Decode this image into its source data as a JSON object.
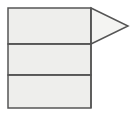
{
  "figure": {
    "canvas": {
      "width": 134,
      "height": 118,
      "background_color": "#ffffff"
    },
    "style": {
      "band_fill_color": "#eeeeec",
      "arrow_fill_color": "#f4f4f2",
      "stroke_color": "#555555",
      "stroke_width": 1.5
    },
    "shapes": {
      "rectangle": {
        "name": "stacked-band-rectangle",
        "x": 8,
        "y": 8,
        "width": 83,
        "height": 100,
        "fill": "#eeeeec",
        "stroke": "#555555"
      },
      "bands": [
        {
          "name": "band-top",
          "label": "",
          "x": 8,
          "y": 8,
          "width": 83,
          "height": 36,
          "fill": "#eeeeec"
        },
        {
          "name": "band-middle",
          "label": "",
          "x": 8,
          "y": 44,
          "width": 83,
          "height": 31,
          "fill": "#eeeeec"
        },
        {
          "name": "band-bottom",
          "label": "",
          "x": 8,
          "y": 75,
          "width": 83,
          "height": 33,
          "fill": "#eeeeec"
        }
      ],
      "dividers": [
        {
          "name": "divider-1",
          "y": 44,
          "x1": 8,
          "x2": 91
        },
        {
          "name": "divider-2",
          "y": 75,
          "x1": 8,
          "x2": 91
        }
      ],
      "arrow_head": {
        "name": "right-pointing-triangle",
        "direction": "right",
        "points": "91,8 128,26 91,44",
        "apex_x": 128,
        "apex_y": 26,
        "fill": "#f4f4f2",
        "stroke": "#555555"
      }
    }
  }
}
